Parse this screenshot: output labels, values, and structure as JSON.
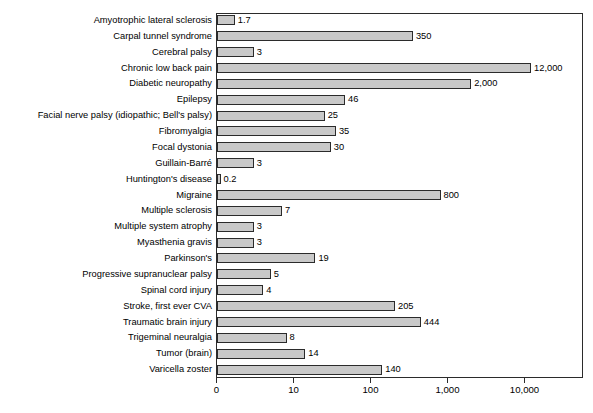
{
  "chart_data": {
    "type": "bar",
    "orientation": "horizontal",
    "title": "",
    "subtitle": "",
    "xlabel": "",
    "ylabel": "",
    "xscale": "log",
    "grid": false,
    "legend": null,
    "xticks": [
      "0",
      "10",
      "100",
      "1,000",
      "10,000"
    ],
    "xtick_values": [
      1,
      10,
      100,
      1000,
      10000
    ],
    "xlim": [
      1,
      30000
    ],
    "bar_fill": "#c9c9c9",
    "bar_stroke": "#2b2b2b",
    "categories": [
      "Amyotrophic lateral sclerosis",
      "Carpal tunnel syndrome",
      "Cerebral palsy",
      "Chronic low back pain",
      "Diabetic neuropathy",
      "Epilepsy",
      "Facial nerve palsy (idiopathic; Bell's palsy)",
      "Fibromyalgia",
      "Focal dystonia",
      "Guillain-Barré",
      "Huntington's disease",
      "Migraine",
      "Multiple sclerosis",
      "Multiple system atrophy",
      "Myasthenia gravis",
      "Parkinson's",
      "Progressive supranuclear palsy",
      "Spinal cord injury",
      "Stroke, first ever CVA",
      "Traumatic brain injury",
      "Trigeminal neuralgia",
      "Tumor (brain)",
      "Varicella zoster"
    ],
    "values": [
      1.7,
      350,
      3,
      12000,
      2000,
      46,
      25,
      35,
      30,
      3,
      0.2,
      800,
      7,
      3,
      3,
      19,
      5,
      4,
      205,
      444,
      8,
      14,
      140
    ],
    "value_labels": [
      "1.7",
      "350",
      "3",
      "12,000",
      "2,000",
      "46",
      "25",
      "35",
      "30",
      "3",
      "0.2",
      "800",
      "7",
      "3",
      "3",
      "19",
      "5",
      "4",
      "205",
      "444",
      "8",
      "14",
      "140"
    ]
  }
}
